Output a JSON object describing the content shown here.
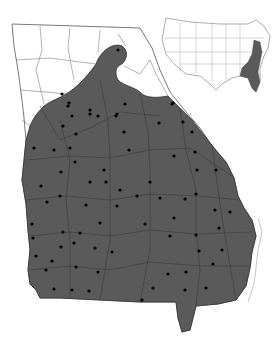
{
  "map": {
    "subject": "Georgia county distribution map",
    "region": "Georgia",
    "shaded_color": "#5a5a5a",
    "unshaded_color": "#ffffff",
    "border_color": "#333333",
    "dot_color": "#000000",
    "inset": {
      "region": "United States",
      "highlighted_states": [
        "Georgia",
        "Florida",
        "South Carolina",
        "North Carolina",
        "Virginia",
        "Maryland",
        "Delaware",
        "New Jersey"
      ],
      "highlight_color": "#5a5a5a"
    },
    "legend": {
      "shaded": "Present (counties shaded)",
      "dot": "County record"
    }
  }
}
